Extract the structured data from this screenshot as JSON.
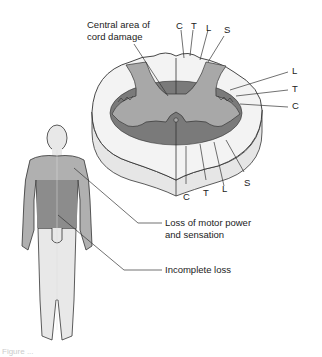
{
  "diagram": {
    "topic": "Central cord syndrome",
    "cord_labels": {
      "central_damage": "Central area of\ncord damage",
      "top": [
        "C",
        "T",
        "L",
        "S"
      ],
      "right": [
        "L",
        "T",
        "C"
      ],
      "bottom": [
        "C",
        "T",
        "L",
        "S"
      ]
    },
    "body_labels": {
      "motor_loss": "Loss of motor power\nand sensation",
      "incomplete_loss": "Incomplete loss"
    },
    "caption": "Figure ..."
  },
  "colors": {
    "white_matter": "#f3f3f3",
    "cord_side": "#e6e6e6",
    "gray_matter": "#a8a8a8",
    "damage": "#7a7a7a",
    "body_upper": "#b0b0b0",
    "body_torso": "#8c8c8c",
    "body_lower": "#e8e8e8",
    "outline": "#333333"
  }
}
